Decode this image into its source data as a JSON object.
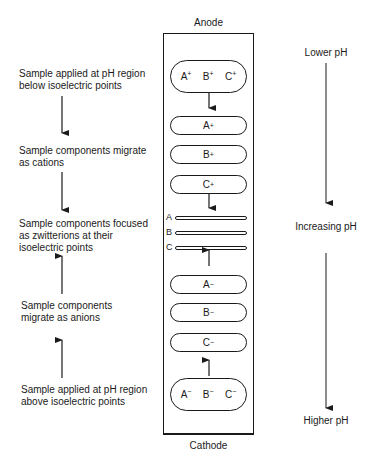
{
  "column": {
    "top_label": "Anode",
    "bottom_label": "Cathode",
    "top_sample": [
      "A",
      "B",
      "C"
    ],
    "top_sample_charge": "+",
    "cations": [
      {
        "species": "A",
        "charge": "+"
      },
      {
        "species": "B",
        "charge": "+"
      },
      {
        "species": "C",
        "charge": "+"
      }
    ],
    "focused_bands": [
      "A",
      "B",
      "C"
    ],
    "anions": [
      {
        "species": "A",
        "charge": "−"
      },
      {
        "species": "B",
        "charge": "−"
      },
      {
        "species": "C",
        "charge": "−"
      }
    ],
    "bottom_sample": [
      "A",
      "B",
      "C"
    ],
    "bottom_sample_charge": "−"
  },
  "left_annotations": [
    {
      "lines": [
        "Sample applied at pH region",
        "below isoelectric points"
      ]
    },
    {
      "lines": [
        "Sample components migrate",
        "as cations"
      ]
    },
    {
      "lines": [
        "Sample components focused",
        "as zwitterions at their",
        "isoelectric points"
      ]
    },
    {
      "lines": [
        "Sample components",
        "migrate as anions"
      ]
    },
    {
      "lines": [
        "Sample applied at pH region",
        "above isoelectric points"
      ]
    }
  ],
  "right_annotations": {
    "top": "Lower pH",
    "middle": "Increasing pH",
    "bottom": "Higher pH"
  }
}
